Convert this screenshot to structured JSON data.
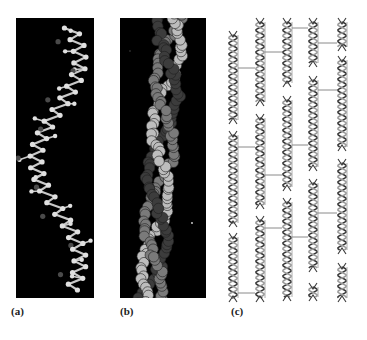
{
  "figure": {
    "panels": [
      {
        "id": "a",
        "label": "(a)",
        "description": "ball-and-stick model of polypeptide helix"
      },
      {
        "id": "b",
        "label": "(b)",
        "description": "space-filling model of triple helix"
      },
      {
        "id": "c",
        "label": "(c)",
        "description": "staggered array of triple-helical molecules with cross-links"
      }
    ]
  },
  "colors": {
    "background": "#000000",
    "stick": "#c8c8c8",
    "atom_light": "#e0e0e0",
    "atom_dark": "#4a4a4a",
    "sphere_light": "#bdbdbd",
    "sphere_mid": "#7a7a7a",
    "sphere_dark": "#3c3c3c",
    "strand_dark": "#3a3a3a",
    "strand_light": "#9a9a9a",
    "crosslink": "#8a8a8a"
  },
  "helix_array": {
    "columns": [
      {
        "x": 11,
        "helices": [
          [
            21,
            106
          ],
          [
            121,
            209
          ],
          [
            223,
            284
          ]
        ]
      },
      {
        "x": 38,
        "helices": [
          [
            8,
            88
          ],
          [
            104,
            191
          ],
          [
            206,
            284
          ]
        ]
      },
      {
        "x": 65,
        "helices": [
          [
            8,
            69
          ],
          [
            86,
            173
          ],
          [
            188,
            283
          ]
        ]
      },
      {
        "x": 91,
        "helices": [
          [
            8,
            49
          ],
          [
            66,
            153
          ],
          [
            169,
            254
          ],
          [
            273,
            283
          ]
        ]
      },
      {
        "x": 120,
        "helices": [
          [
            8,
            33
          ],
          [
            46,
            133
          ],
          [
            149,
            236
          ],
          [
            253,
            284
          ]
        ]
      }
    ],
    "crosslinks": [
      {
        "from": 0,
        "y": 54
      },
      {
        "from": 0,
        "y": 133
      },
      {
        "from": 0,
        "y": 279
      },
      {
        "from": 1,
        "y": 38
      },
      {
        "from": 1,
        "y": 161
      },
      {
        "from": 1,
        "y": 214
      },
      {
        "from": 2,
        "y": 14
      },
      {
        "from": 2,
        "y": 131
      },
      {
        "from": 2,
        "y": 223
      },
      {
        "from": 3,
        "y": 29
      },
      {
        "from": 3,
        "y": 76
      },
      {
        "from": 3,
        "y": 199
      }
    ]
  }
}
